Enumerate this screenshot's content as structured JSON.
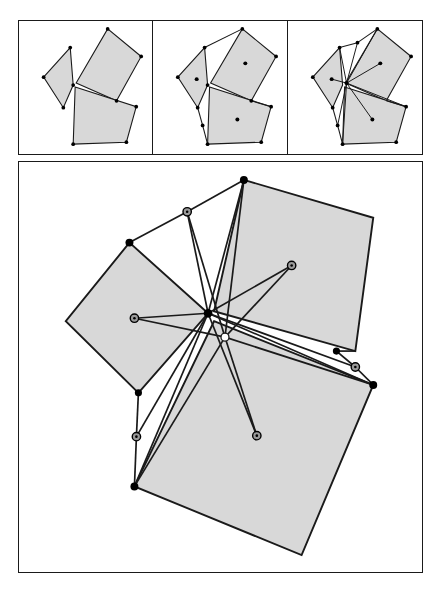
{
  "figure": {
    "title": "Three squares construction: centers, cevians and concurrency",
    "type": "geometric-diagram",
    "background_color": "#ffffff",
    "frame_color": "#1a1a1a",
    "square_fill": "#d8d8d8",
    "square_stroke": "#1a1a1a",
    "vertex_marker_fill": "#000000",
    "center_marker_fill": "#000000",
    "ring_marker_fill": "#9a9a9a",
    "ring_marker_stroke": "#000000",
    "hollow_marker_fill": "#ffffff"
  },
  "panels": [
    {
      "id": "panel-1",
      "label": "Step 1: three squares sharing a common vertex",
      "viewbox": "0 0 135 135",
      "squares": [
        {
          "name": "left-square",
          "points": "55,65 52,27 25,57 45,88"
        },
        {
          "name": "upper-square",
          "points": "58,63 90,8 124,36 99,81"
        },
        {
          "name": "lower-square",
          "points": "57,67 119,87 109,123 55,125"
        }
      ],
      "vertices": [
        {
          "x": 55,
          "y": 65
        },
        {
          "x": 52,
          "y": 27
        },
        {
          "x": 25,
          "y": 57
        },
        {
          "x": 45,
          "y": 88
        },
        {
          "x": 90,
          "y": 8
        },
        {
          "x": 124,
          "y": 36
        },
        {
          "x": 99,
          "y": 81
        },
        {
          "x": 119,
          "y": 87
        },
        {
          "x": 109,
          "y": 123
        },
        {
          "x": 55,
          "y": 125
        }
      ],
      "centers": [],
      "rays": []
    },
    {
      "id": "panel-2",
      "label": "Step 2: square centers marked and joined to opposite vertices",
      "viewbox": "0 0 135 135",
      "squares": [
        {
          "name": "left-square",
          "points": "55,65 52,27 25,57 45,88"
        },
        {
          "name": "upper-square",
          "points": "58,63 90,8 124,36 99,81"
        },
        {
          "name": "lower-square",
          "points": "57,67 119,87 109,123 55,125"
        }
      ],
      "centers": [
        {
          "name": "left-center",
          "x": 44,
          "y": 59
        },
        {
          "name": "upper-center",
          "x": 93,
          "y": 43
        },
        {
          "name": "lower-center",
          "x": 85,
          "y": 100
        }
      ],
      "connectors": [
        {
          "name": "c1",
          "from": [
            52,
            27
          ],
          "to": [
            90,
            8
          ]
        },
        {
          "name": "c2",
          "from": [
            99,
            81
          ],
          "to": [
            119,
            87
          ]
        },
        {
          "name": "c3",
          "from": [
            45,
            88
          ],
          "to": [
            55,
            125
          ]
        }
      ],
      "extra_points": [
        {
          "x": 50,
          "y": 106
        }
      ]
    },
    {
      "id": "panel-3",
      "label": "Step 3: all cevians drawn, concurrency at the shared vertex",
      "viewbox": "0 0 135 135",
      "squares": [
        {
          "name": "left-square",
          "points": "55,65 52,27 25,57 45,88"
        },
        {
          "name": "upper-square",
          "points": "58,63 90,8 124,36 99,81"
        },
        {
          "name": "lower-square",
          "points": "57,67 119,87 109,123 55,125"
        }
      ],
      "centers": [
        {
          "name": "left-center",
          "x": 44,
          "y": 59
        },
        {
          "name": "upper-center",
          "x": 93,
          "y": 43
        },
        {
          "name": "lower-center",
          "x": 85,
          "y": 100
        }
      ],
      "hub": {
        "x": 59,
        "y": 63
      },
      "rays": [
        {
          "name": "ray-to-left-center",
          "to": [
            44,
            59
          ]
        },
        {
          "name": "ray-to-upper-center",
          "to": [
            93,
            43
          ]
        },
        {
          "name": "ray-to-lower-center",
          "to": [
            85,
            100
          ]
        },
        {
          "name": "ray-to-top-vertex",
          "to": [
            90,
            8
          ]
        },
        {
          "name": "ray-to-midtop",
          "to": [
            70,
            22
          ]
        },
        {
          "name": "ray-to-leftvertex",
          "to": [
            52,
            27
          ]
        },
        {
          "name": "ray-to-bottomleft",
          "to": [
            55,
            125
          ]
        },
        {
          "name": "ray-to-lowmid",
          "to": [
            50,
            106
          ]
        },
        {
          "name": "ray-to-rightvertex",
          "to": [
            119,
            87
          ]
        }
      ]
    }
  ],
  "main_panel": {
    "id": "main-panel",
    "label": "Enlarged construction with all cevians and midpoint rings",
    "viewbox": "0 0 405 412",
    "squares": [
      {
        "name": "left-square",
        "points": "190,152 111,81 47,160 120,232"
      },
      {
        "name": "upper-square",
        "points": "196,150 226,18 356,56 338,190"
      },
      {
        "name": "right-square",
        "points": "196,160 356,224 284,395 116,326"
      }
    ],
    "hub": {
      "name": "concurrency-hub",
      "x": 190,
      "y": 152
    },
    "second_hub": {
      "name": "secondary-node",
      "x": 207,
      "y": 176
    },
    "vertices": [
      {
        "name": "v-top",
        "x": 226,
        "y": 18
      },
      {
        "name": "v-upper-right",
        "x": 356,
        "y": 56
      },
      {
        "name": "v-left-top",
        "x": 111,
        "y": 81
      },
      {
        "name": "v-left-left",
        "x": 47,
        "y": 160
      },
      {
        "name": "v-left-bottom",
        "x": 120,
        "y": 232
      },
      {
        "name": "v-mid-right",
        "x": 319,
        "y": 190
      },
      {
        "name": "v-right-corner",
        "x": 356,
        "y": 224
      },
      {
        "name": "v-bottom-left",
        "x": 116,
        "y": 326
      },
      {
        "name": "v-bottom",
        "x": 284,
        "y": 395
      },
      {
        "name": "v-hub",
        "x": 190,
        "y": 152
      }
    ],
    "ring_markers": [
      {
        "name": "ring-upper-left",
        "x": 169,
        "y": 50
      },
      {
        "name": "ring-upper-right",
        "x": 274,
        "y": 104
      },
      {
        "name": "ring-left",
        "x": 116,
        "y": 157
      },
      {
        "name": "ring-right-edge",
        "x": 338,
        "y": 206
      },
      {
        "name": "ring-lower",
        "x": 239,
        "y": 275
      },
      {
        "name": "ring-bottom-left",
        "x": 118,
        "y": 276
      }
    ],
    "hollow_marker": {
      "name": "white-node",
      "x": 207,
      "y": 176
    },
    "cevians": [
      {
        "name": "cevian-to-upper-right-center",
        "from": [
          190,
          152
        ],
        "to": [
          274,
          104
        ]
      },
      {
        "name": "cevian-to-left-center",
        "from": [
          190,
          152
        ],
        "to": [
          116,
          157
        ]
      },
      {
        "name": "cevian-to-lower-center",
        "from": [
          190,
          152
        ],
        "to": [
          239,
          275
        ]
      },
      {
        "name": "cevian-hub-to-top",
        "from": [
          190,
          152
        ],
        "to": [
          226,
          18
        ]
      },
      {
        "name": "cevian-hub-to-ring-upper",
        "from": [
          190,
          152
        ],
        "to": [
          169,
          50
        ]
      },
      {
        "name": "cevian-hub-to-bottomleft",
        "from": [
          190,
          152
        ],
        "to": [
          116,
          326
        ]
      },
      {
        "name": "cevian-hub-to-ringbl",
        "from": [
          190,
          152
        ],
        "to": [
          118,
          276
        ]
      },
      {
        "name": "cevian-hub-to-rightedge",
        "from": [
          190,
          152
        ],
        "to": [
          338,
          206
        ]
      },
      {
        "name": "cevian-hub-to-rightcorner",
        "from": [
          190,
          152
        ],
        "to": [
          356,
          224
        ]
      },
      {
        "name": "cevian-node-to-top",
        "from": [
          207,
          176
        ],
        "to": [
          226,
          18
        ]
      },
      {
        "name": "cevian-node-to-ring-upper",
        "from": [
          207,
          176
        ],
        "to": [
          169,
          50
        ]
      },
      {
        "name": "cevian-node-to-bottomleft",
        "from": [
          207,
          176
        ],
        "to": [
          116,
          326
        ]
      },
      {
        "name": "cevian-node-to-lower",
        "from": [
          207,
          176
        ],
        "to": [
          239,
          275
        ]
      },
      {
        "name": "cevian-node-to-left",
        "from": [
          207,
          176
        ],
        "to": [
          116,
          157
        ]
      },
      {
        "name": "cevian-node-to-rightcorner",
        "from": [
          207,
          176
        ],
        "to": [
          356,
          224
        ]
      },
      {
        "name": "cevian-node-to-upperright",
        "from": [
          207,
          176
        ],
        "to": [
          274,
          104
        ]
      }
    ],
    "connector_edges": [
      {
        "name": "edge-lefttop-to-ring",
        "from": [
          111,
          81
        ],
        "to": [
          169,
          50
        ]
      },
      {
        "name": "edge-ring-to-top",
        "from": [
          169,
          50
        ],
        "to": [
          226,
          18
        ]
      },
      {
        "name": "edge-midright-to-ring",
        "from": [
          319,
          190
        ],
        "to": [
          338,
          206
        ]
      },
      {
        "name": "edge-ring-to-corner",
        "from": [
          338,
          206
        ],
        "to": [
          356,
          224
        ]
      },
      {
        "name": "edge-leftbottom-to-ring",
        "from": [
          120,
          232
        ],
        "to": [
          118,
          276
        ]
      },
      {
        "name": "edge-ring-to-bottomleft",
        "from": [
          118,
          276
        ],
        "to": [
          116,
          326
        ]
      }
    ]
  }
}
